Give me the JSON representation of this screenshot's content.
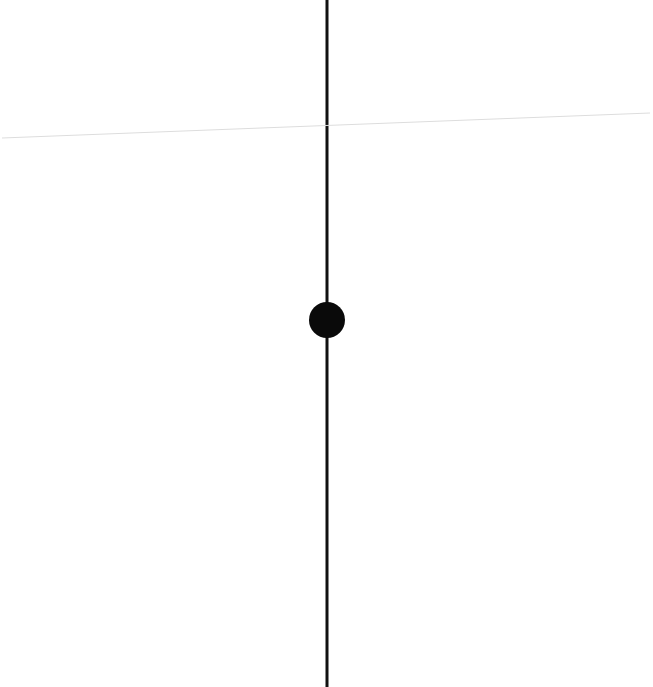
{
  "diagram": {
    "background": "#ffffff",
    "vertical_line": {
      "x": 327,
      "y1": 0,
      "y2": 687,
      "color": "#111111",
      "width": 3
    },
    "slanted_line": {
      "x1": 2,
      "y1": 138,
      "x2": 650,
      "y2": 113,
      "color": "#dddddd",
      "width": 1
    },
    "point": {
      "cx": 327,
      "cy": 320,
      "r": 18,
      "color": "#0a0a0a"
    }
  }
}
